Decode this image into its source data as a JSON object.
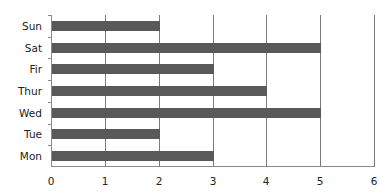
{
  "chart_data": {
    "type": "bar",
    "orientation": "horizontal",
    "title": "",
    "xlabel": "",
    "ylabel": "",
    "categories": [
      "Sun",
      "Sat",
      "Fir",
      "Thur",
      "Wed",
      "Tue",
      "Mon"
    ],
    "values": [
      2,
      5,
      3,
      4,
      5,
      2,
      3
    ],
    "xlim": [
      0,
      6
    ],
    "x_ticks": [
      "0",
      "1",
      "2",
      "3",
      "4",
      "5",
      "6"
    ],
    "grid": "vertical",
    "legend": "none",
    "bar_color": "#595959"
  }
}
